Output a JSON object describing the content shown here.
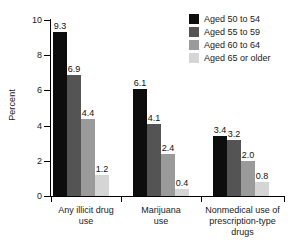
{
  "chart_data": {
    "type": "bar",
    "title": "",
    "subtitle": "",
    "xlabel": "",
    "ylabel": "Percent",
    "ylim": [
      0,
      10
    ],
    "yticks": [
      0,
      2,
      4,
      6,
      8,
      10
    ],
    "grid": false,
    "legend_position": "top-right",
    "categories": [
      "Any illicit drug use",
      "Marijuana use",
      "Nonmedical use of prescription-type drugs"
    ],
    "series": [
      {
        "name": "Aged 50 to 54",
        "color": "#0d0d0d",
        "values": [
          9.3,
          6.1,
          3.4
        ]
      },
      {
        "name": "Aged 55 to 59",
        "color": "#545454",
        "values": [
          6.9,
          4.1,
          3.2
        ]
      },
      {
        "name": "Aged 60 to 64",
        "color": "#9a9a9a",
        "values": [
          4.4,
          2.4,
          2.0
        ]
      },
      {
        "name": "Aged 65 or older",
        "color": "#d5d5d5",
        "values": [
          1.2,
          0.4,
          0.8
        ]
      }
    ]
  },
  "axis": {
    "y_title": "Percent",
    "tick_labels": [
      "10",
      "8",
      "6",
      "4",
      "2",
      "0"
    ]
  },
  "categories_display": [
    {
      "line1": "Any illicit drug",
      "line2": "use",
      "line3": ""
    },
    {
      "line1": "Marijuana",
      "line2": "use",
      "line3": ""
    },
    {
      "line1": "Nonmedical use of",
      "line2": "prescription-type",
      "line3": "drugs"
    }
  ],
  "legend": {
    "items": [
      {
        "label": "Aged 50 to 54",
        "color": "#0d0d0d"
      },
      {
        "label": "Aged 55 to 59",
        "color": "#545454"
      },
      {
        "label": "Aged 60 to 64",
        "color": "#9a9a9a"
      },
      {
        "label": "Aged 65 or older",
        "color": "#d5d5d5"
      }
    ]
  },
  "values_display": {
    "g0": [
      "9.3",
      "6.9",
      "4.4",
      "1.2"
    ],
    "g1": [
      "6.1",
      "4.1",
      "2.4",
      "0.4"
    ],
    "g2": [
      "3.4",
      "3.2",
      "2.0",
      "0.8"
    ]
  }
}
